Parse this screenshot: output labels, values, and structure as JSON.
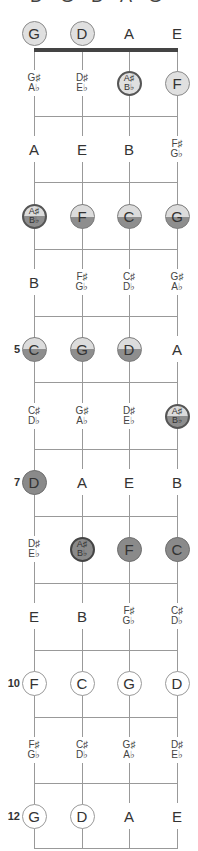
{
  "title": "D G D A G",
  "layout": {
    "string_x": [
      34,
      82,
      129,
      177
    ],
    "open_row_y": 33,
    "nut_y": 50,
    "fret_y": [
      116,
      182,
      249,
      316,
      382,
      449,
      516,
      583,
      650,
      717,
      783,
      848
    ],
    "row_y": [
      83,
      149,
      216,
      282,
      349,
      416,
      482,
      549,
      616,
      683,
      750,
      816
    ]
  },
  "colors": {
    "light": "#e0e0e0",
    "dark": "#8a8a8a",
    "line": "#999999",
    "nut": "#444444"
  },
  "fret_numbers": [
    {
      "fret": 5,
      "label": "5"
    },
    {
      "fret": 7,
      "label": "7"
    },
    {
      "fret": 10,
      "label": "10"
    },
    {
      "fret": 12,
      "label": "12"
    }
  ],
  "rows": [
    {
      "fret": 0,
      "notes": [
        {
          "text": "G",
          "style": "light"
        },
        {
          "text": "D",
          "style": "light"
        },
        {
          "text": "A",
          "style": "plain"
        },
        {
          "text": "E",
          "style": "plain"
        }
      ]
    },
    {
      "fret": 1,
      "notes": [
        {
          "text": "G♯",
          "text2": "A♭",
          "style": "plain"
        },
        {
          "text": "D♯",
          "text2": "E♭",
          "style": "plain"
        },
        {
          "text": "A♯",
          "text2": "B♭",
          "style": "light-darkborder"
        },
        {
          "text": "F",
          "style": "light"
        }
      ]
    },
    {
      "fret": 2,
      "notes": [
        {
          "text": "A",
          "style": "plain"
        },
        {
          "text": "E",
          "style": "plain"
        },
        {
          "text": "B",
          "style": "plain"
        },
        {
          "text": "F♯",
          "text2": "G♭",
          "style": "plain"
        }
      ]
    },
    {
      "fret": 3,
      "notes": [
        {
          "text": "A♯",
          "text2": "B♭",
          "style": "half-darkborder"
        },
        {
          "text": "F",
          "style": "half"
        },
        {
          "text": "C",
          "style": "half"
        },
        {
          "text": "G",
          "style": "half"
        }
      ]
    },
    {
      "fret": 4,
      "notes": [
        {
          "text": "B",
          "style": "plain"
        },
        {
          "text": "F♯",
          "text2": "G♭",
          "style": "plain"
        },
        {
          "text": "C♯",
          "text2": "D♭",
          "style": "plain"
        },
        {
          "text": "G♯",
          "text2": "A♭",
          "style": "plain"
        }
      ]
    },
    {
      "fret": 5,
      "notes": [
        {
          "text": "C",
          "style": "half"
        },
        {
          "text": "G",
          "style": "half"
        },
        {
          "text": "D",
          "style": "half"
        },
        {
          "text": "A",
          "style": "plain"
        }
      ]
    },
    {
      "fret": 6,
      "notes": [
        {
          "text": "C♯",
          "text2": "D♭",
          "style": "plain"
        },
        {
          "text": "G♯",
          "text2": "A♭",
          "style": "plain"
        },
        {
          "text": "D♯",
          "text2": "E♭",
          "style": "plain"
        },
        {
          "text": "A♯",
          "text2": "B♭",
          "style": "half-darkborder"
        }
      ]
    },
    {
      "fret": 7,
      "notes": [
        {
          "text": "D",
          "style": "dark"
        },
        {
          "text": "A",
          "style": "plain"
        },
        {
          "text": "E",
          "style": "plain"
        },
        {
          "text": "B",
          "style": "plain"
        }
      ]
    },
    {
      "fret": 8,
      "notes": [
        {
          "text": "D♯",
          "text2": "E♭",
          "style": "plain"
        },
        {
          "text": "A♯",
          "text2": "B♭",
          "style": "dark-darkborder"
        },
        {
          "text": "F",
          "style": "dark"
        },
        {
          "text": "C",
          "style": "dark"
        }
      ]
    },
    {
      "fret": 9,
      "notes": [
        {
          "text": "E",
          "style": "plain"
        },
        {
          "text": "B",
          "style": "plain"
        },
        {
          "text": "F♯",
          "text2": "G♭",
          "style": "plain"
        },
        {
          "text": "C♯",
          "text2": "D♭",
          "style": "plain"
        }
      ]
    },
    {
      "fret": 10,
      "notes": [
        {
          "text": "F",
          "style": "outline"
        },
        {
          "text": "C",
          "style": "outline"
        },
        {
          "text": "G",
          "style": "outline"
        },
        {
          "text": "D",
          "style": "outline"
        }
      ]
    },
    {
      "fret": 11,
      "notes": [
        {
          "text": "F♯",
          "text2": "G♭",
          "style": "plain"
        },
        {
          "text": "C♯",
          "text2": "D♭",
          "style": "plain"
        },
        {
          "text": "G♯",
          "text2": "A♭",
          "style": "plain"
        },
        {
          "text": "D♯",
          "text2": "E♭",
          "style": "plain"
        }
      ]
    },
    {
      "fret": 12,
      "notes": [
        {
          "text": "G",
          "style": "outline"
        },
        {
          "text": "D",
          "style": "outline"
        },
        {
          "text": "A",
          "style": "plain"
        },
        {
          "text": "E",
          "style": "plain"
        }
      ]
    }
  ]
}
